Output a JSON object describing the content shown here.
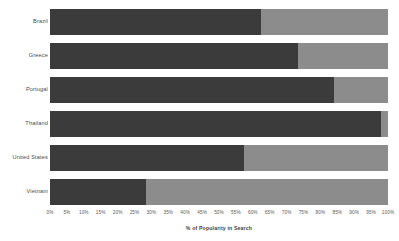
{
  "chart_data": {
    "type": "bar",
    "orientation": "horizontal",
    "stacked": true,
    "normalized": true,
    "title": "",
    "subtitle": "",
    "xlabel": "% of Popularity in Search",
    "ylabel": "",
    "xlim": [
      0,
      100
    ],
    "grid": false,
    "legend_position": "none",
    "categories": [
      "Brazil",
      "Greece",
      "Portugal",
      "Thailand",
      "United States",
      "Vietnam"
    ],
    "series": [
      {
        "name": "primary-share",
        "color": "#3b3b3b",
        "values": [
          62.5,
          73.5,
          84.0,
          98.0,
          57.5,
          28.5
        ]
      },
      {
        "name": "secondary-share",
        "color": "#8c8c8c",
        "values": [
          37.5,
          26.5,
          16.0,
          2.0,
          42.5,
          71.5
        ]
      }
    ],
    "xticks": [
      0,
      5,
      10,
      15,
      20,
      25,
      30,
      35,
      40,
      45,
      50,
      55,
      60,
      65,
      70,
      75,
      80,
      85,
      90,
      95,
      100
    ],
    "xtick_labels": [
      "0%",
      "5%",
      "10%",
      "15%",
      "20%",
      "25%",
      "30%",
      "35%",
      "40%",
      "45%",
      "50%",
      "55%",
      "60%",
      "65%",
      "70%",
      "75%",
      "80%",
      "85%",
      "90%",
      "95%",
      "100%"
    ]
  },
  "colors": {
    "background": "#ffffff",
    "primary": "#3b3b3b",
    "secondary": "#8c8c8c",
    "label_text": "#4a4a4a",
    "tick_text": "#5a5a5a",
    "axis_title_text": "#3f3f3f"
  }
}
